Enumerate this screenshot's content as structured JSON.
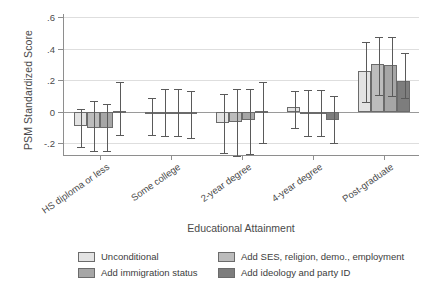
{
  "chart_data": {
    "type": "bar",
    "title": "",
    "xlabel": "Educational Attainment",
    "ylabel": "PSM Standardized Score",
    "categories": [
      "HS diploma or less",
      "Some college",
      "2-year degree",
      "4-year degree",
      "Post-graduate"
    ],
    "ylim": [
      -0.28,
      0.62
    ],
    "yticks": [
      -0.2,
      0,
      0.2,
      0.4,
      0.6
    ],
    "ytick_labels": [
      "-.2",
      "0",
      ".2",
      ".4",
      ".6"
    ],
    "grid": true,
    "legend_position": "bottom",
    "error_bars": "95% confidence interval",
    "series": [
      {
        "name": "Unconditional",
        "color": "#e3e3e3",
        "values": [
          -0.09,
          -0.015,
          -0.07,
          0.03,
          0.26
        ],
        "ci_low": [
          -0.22,
          -0.145,
          -0.26,
          -0.1,
          0.065
        ],
        "ci_high": [
          0.015,
          0.09,
          0.11,
          0.135,
          0.44
        ]
      },
      {
        "name": "Add SES, religion, demo., employment",
        "color": "#bcbcbc",
        "values": [
          -0.1,
          -0.005,
          -0.065,
          0.0,
          0.3
        ],
        "ci_low": [
          -0.25,
          -0.155,
          -0.28,
          -0.155,
          0.105
        ],
        "ci_high": [
          0.07,
          0.145,
          0.145,
          0.14,
          0.475
        ]
      },
      {
        "name": "Add immigration status",
        "color": "#a6a6a6",
        "values": [
          -0.1,
          -0.005,
          -0.05,
          0.0,
          0.295
        ],
        "ci_low": [
          -0.25,
          -0.155,
          -0.27,
          -0.155,
          0.1
        ],
        "ci_high": [
          0.05,
          0.145,
          0.145,
          0.14,
          0.475
        ]
      },
      {
        "name": "Add ideology and party ID",
        "color": "#7d7d7d",
        "values": [
          0.005,
          -0.015,
          0.005,
          -0.05,
          0.195
        ],
        "ci_low": [
          -0.145,
          -0.165,
          -0.2,
          -0.2,
          0.09
        ],
        "ci_high": [
          0.19,
          0.135,
          0.19,
          0.1,
          0.37
        ]
      }
    ]
  },
  "legend": {
    "items": [
      {
        "label": "Unconditional",
        "color": "#e3e3e3"
      },
      {
        "label": "Add SES, religion, demo., employment",
        "color": "#bcbcbc"
      },
      {
        "label": "Add immigration status",
        "color": "#a6a6a6"
      },
      {
        "label": "Add ideology and party ID",
        "color": "#7d7d7d"
      }
    ]
  },
  "axis": {
    "y_title": "PSM Standardized Score",
    "x_title": "Educational Attainment"
  }
}
